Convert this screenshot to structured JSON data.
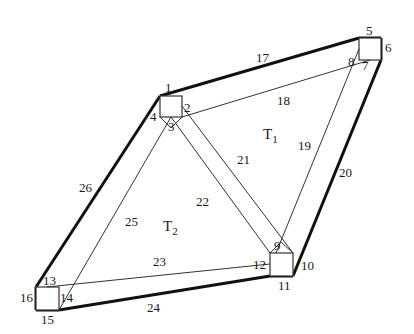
{
  "diagram": {
    "type": "truss-frame",
    "regions": [
      {
        "id": "T1",
        "main": "T",
        "sub": "1",
        "x": 263,
        "y": 139
      },
      {
        "id": "T2",
        "main": "T",
        "sub": "2",
        "x": 163,
        "y": 231
      }
    ],
    "boxes": [
      {
        "id": "A",
        "x": 160,
        "y": 96,
        "w": 22,
        "h": 21
      },
      {
        "id": "B",
        "x": 359,
        "y": 38,
        "w": 22,
        "h": 22
      },
      {
        "id": "C",
        "x": 270,
        "y": 253,
        "w": 23,
        "h": 23
      },
      {
        "id": "D",
        "x": 36,
        "y": 287,
        "w": 23,
        "h": 23
      }
    ],
    "nodes": [
      {
        "n": "1",
        "x": 165,
        "y": 92
      },
      {
        "n": "2",
        "x": 184,
        "y": 112
      },
      {
        "n": "3",
        "x": 168,
        "y": 131
      },
      {
        "n": "4",
        "x": 150,
        "y": 121
      },
      {
        "n": "5",
        "x": 366,
        "y": 35
      },
      {
        "n": "6",
        "x": 385,
        "y": 52
      },
      {
        "n": "7",
        "x": 362,
        "y": 70
      },
      {
        "n": "8",
        "x": 348,
        "y": 66
      },
      {
        "n": "9",
        "x": 274,
        "y": 250
      },
      {
        "n": "10",
        "x": 301,
        "y": 270
      },
      {
        "n": "11",
        "x": 278,
        "y": 290
      },
      {
        "n": "12",
        "x": 253,
        "y": 269
      },
      {
        "n": "13",
        "x": 43,
        "y": 285
      },
      {
        "n": "14",
        "x": 60,
        "y": 302
      },
      {
        "n": "15",
        "x": 41,
        "y": 324
      },
      {
        "n": "16",
        "x": 20,
        "y": 302
      }
    ],
    "members": [
      {
        "n": "17",
        "x": 256,
        "y": 62
      },
      {
        "n": "18",
        "x": 277,
        "y": 105
      },
      {
        "n": "19",
        "x": 298,
        "y": 150
      },
      {
        "n": "20",
        "x": 339,
        "y": 177
      },
      {
        "n": "21",
        "x": 237,
        "y": 164
      },
      {
        "n": "22",
        "x": 196,
        "y": 206
      },
      {
        "n": "23",
        "x": 153,
        "y": 266
      },
      {
        "n": "24",
        "x": 147,
        "y": 312
      },
      {
        "n": "25",
        "x": 125,
        "y": 226
      },
      {
        "n": "26",
        "x": 79,
        "y": 192
      }
    ]
  }
}
